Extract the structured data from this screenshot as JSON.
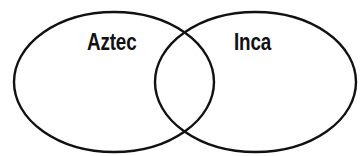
{
  "diagram": {
    "type": "venn",
    "sets": [
      {
        "label": "Aztec",
        "shape": "ellipse",
        "cx": 114,
        "cy": 82,
        "rx": 100,
        "ry": 70
      },
      {
        "label": "Inca",
        "shape": "ellipse",
        "cx": 255.5,
        "cy": 82,
        "rx": 100.5,
        "ry": 70
      }
    ],
    "stroke_color": "#111111",
    "fill_color": "#ffffff",
    "background": "#ffffff"
  }
}
